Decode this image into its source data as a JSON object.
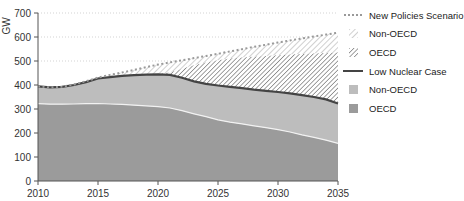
{
  "chart_data": {
    "type": "area",
    "title": "",
    "xlabel": "",
    "ylabel": "GW",
    "x": [
      2010,
      2011,
      2012,
      2013,
      2014,
      2015,
      2016,
      2017,
      2018,
      2019,
      2020,
      2021,
      2022,
      2023,
      2024,
      2025,
      2026,
      2027,
      2028,
      2029,
      2030,
      2031,
      2032,
      2033,
      2034,
      2035
    ],
    "xlim": [
      2010,
      2035
    ],
    "ylim": [
      0,
      700
    ],
    "x_ticks": [
      2010,
      2015,
      2020,
      2025,
      2030,
      2035
    ],
    "y_ticks": [
      0,
      100,
      200,
      300,
      400,
      500,
      600,
      700
    ],
    "grid": "horizontal dotted at 500, 600, 700",
    "legend_position": "right",
    "series": [
      {
        "name": "OECD",
        "group": "Low Nuclear Case",
        "style": "solid dark grey",
        "values": [
          322,
          320,
          320,
          321,
          322,
          323,
          321,
          319,
          316,
          313,
          310,
          304,
          293,
          280,
          268,
          255,
          245,
          238,
          230,
          222,
          214,
          204,
          192,
          182,
          170,
          157
        ]
      },
      {
        "name": "Non-OECD",
        "group": "Low Nuclear Case",
        "style": "solid light grey",
        "cumulative_top": [
          394,
          390,
          392,
          400,
          412,
          427,
          433,
          438,
          441,
          443,
          444,
          442,
          430,
          415,
          405,
          398,
          392,
          387,
          381,
          376,
          371,
          365,
          358,
          350,
          340,
          323
        ]
      },
      {
        "name": "Low Nuclear Case",
        "style": "dark line",
        "values": [
          394,
          390,
          392,
          400,
          412,
          427,
          433,
          438,
          441,
          443,
          444,
          442,
          430,
          415,
          405,
          398,
          392,
          387,
          381,
          376,
          371,
          365,
          358,
          350,
          340,
          323
        ]
      },
      {
        "name": "OECD",
        "group": "New Policies Scenario",
        "style": "dense hatch",
        "cumulative_top": [
          394,
          390,
          392,
          400,
          412,
          427,
          433,
          438,
          441,
          443,
          446,
          452,
          468,
          482,
          494,
          503,
          510,
          514,
          518,
          521,
          524,
          527,
          529,
          531,
          533,
          535
        ]
      },
      {
        "name": "Non-OECD",
        "group": "New Policies Scenario",
        "style": "light hatch",
        "cumulative_top": [
          394,
          390,
          393,
          402,
          416,
          431,
          442,
          452,
          463,
          474,
          485,
          494,
          503,
          512,
          521,
          530,
          540,
          549,
          559,
          568,
          577,
          586,
          594,
          602,
          610,
          618
        ]
      },
      {
        "name": "New Policies Scenario",
        "style": "dotted line",
        "values": [
          394,
          390,
          393,
          402,
          416,
          431,
          442,
          452,
          463,
          474,
          485,
          494,
          503,
          512,
          521,
          530,
          540,
          549,
          559,
          568,
          577,
          586,
          594,
          602,
          610,
          618
        ]
      }
    ],
    "legend": [
      "New Policies Scenario",
      "Non-OECD",
      "OECD",
      "Low Nuclear Case",
      "Non-OECD",
      "OECD"
    ]
  },
  "axis": {
    "ylabel": "GW",
    "y_tick_labels": [
      "0",
      "100",
      "200",
      "300",
      "400",
      "500",
      "600",
      "700"
    ],
    "x_tick_labels": [
      "2010",
      "2015",
      "2020",
      "2025",
      "2030",
      "2035"
    ]
  },
  "legend": {
    "items": [
      {
        "label": "New Policies Scenario",
        "swatch": "dotted-line"
      },
      {
        "label": "Non-OECD",
        "swatch": "light-hatch"
      },
      {
        "label": "OECD",
        "swatch": "dense-hatch"
      },
      {
        "label": "Low Nuclear Case",
        "swatch": "dark-line"
      },
      {
        "label": "Non-OECD",
        "swatch": "light-grey"
      },
      {
        "label": "OECD",
        "swatch": "dark-grey"
      }
    ]
  },
  "colors": {
    "oecd_solid": "#9b9b9b",
    "nonoecd_solid": "#bdbdbd",
    "line_dark": "#444444",
    "dotted": "#9a9a9a",
    "hatch_dark": "#8a8a8a",
    "hatch_light": "#c4c4c4",
    "grid": "#c8c8c8"
  }
}
